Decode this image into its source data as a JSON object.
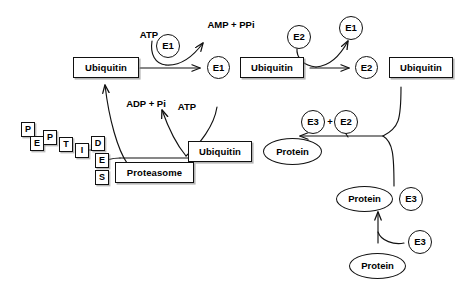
{
  "diagram": {
    "background": "#ffffff",
    "stroke": "#111111",
    "text_color": "#000000"
  },
  "labels": {
    "ubiquitin_free": "Ubiquitin",
    "atp_1": "ATP",
    "e1_catalyst": "E1",
    "amp_ppi": "AMP + PPi",
    "e1_circle": "E1",
    "ubiquitin_e1": "Ubiquitin",
    "e2_catalyst": "E2",
    "e1_released": "E1",
    "e2_circle": "E2",
    "ubiquitin_e2": "Ubiquitin",
    "e3_released": "E3",
    "plus_sign": "+",
    "e2_released": "E2",
    "ubiquitin_tagged": "Ubiquitin",
    "protein_tagged": "Protein",
    "protein_e3_bound": "Protein",
    "e3_bound": "E3",
    "e3_free": "E3",
    "protein_free": "Protein",
    "adp_pi": "ADP + Pi",
    "atp_2": "ATP",
    "proteasome": "Proteasome"
  },
  "peptides": {
    "word": "PEPTIDES",
    "letters": [
      "P",
      "E",
      "P",
      "T",
      "I",
      "D",
      "E",
      "S"
    ]
  }
}
